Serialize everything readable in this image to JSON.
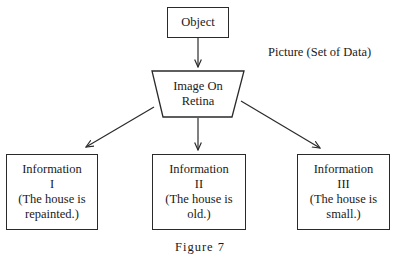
{
  "diagram": {
    "nodes": {
      "object": {
        "label": "Object"
      },
      "retina": {
        "line1": "Image On",
        "line2": "Retina"
      },
      "info1": {
        "title": "Information",
        "numeral": "I",
        "line1": "(The house is",
        "line2": "repainted.)"
      },
      "info2": {
        "title": "Information",
        "numeral": "II",
        "line1": "(The house is",
        "line2": "old.)"
      },
      "info3": {
        "title": "Information",
        "numeral": "III",
        "line1": "(The house is",
        "line2": "small.)"
      }
    },
    "annotation": {
      "label": "Picture (Set of Data)"
    },
    "edges": [
      {
        "from": "object",
        "to": "retina"
      },
      {
        "from": "retina",
        "to": "info1"
      },
      {
        "from": "retina",
        "to": "info2"
      },
      {
        "from": "retina",
        "to": "info3"
      }
    ],
    "caption": "Figure 7",
    "colors": {
      "stroke": "#2a2a2a",
      "text": "#1a1a1a",
      "background": "#ffffff"
    }
  }
}
